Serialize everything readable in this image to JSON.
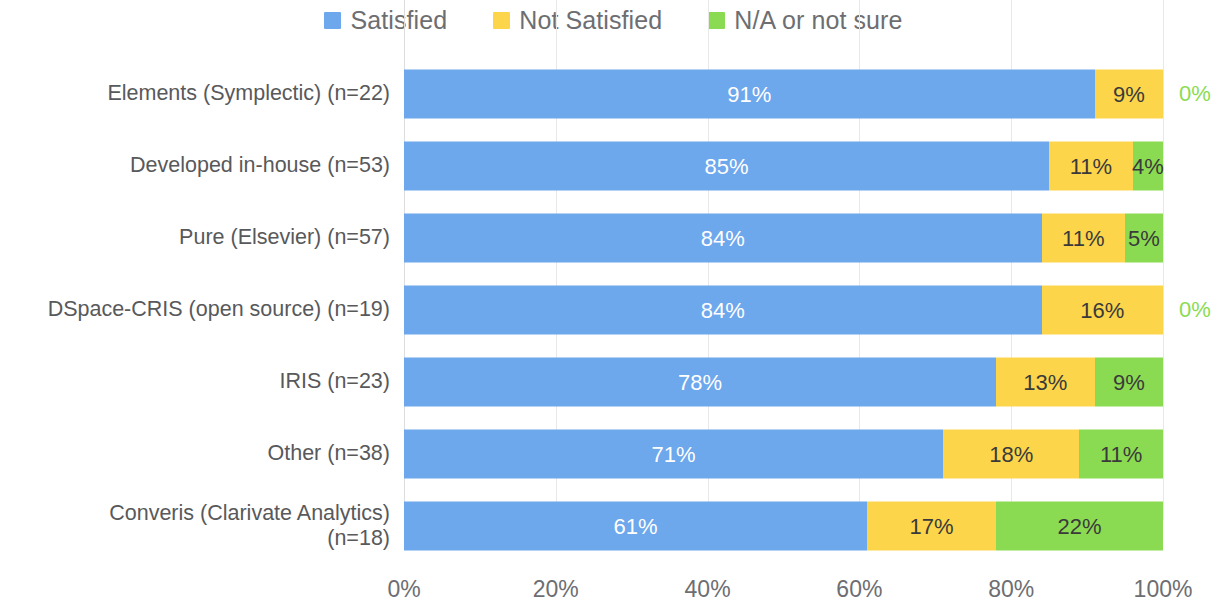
{
  "legend": {
    "items": [
      {
        "label": "Satisfied",
        "color": "#6DA7EC",
        "icon": "square-swatch-icon"
      },
      {
        "label": "Not Satisfied",
        "color": "#FCD54B",
        "icon": "square-swatch-icon"
      },
      {
        "label": "N/A or not sure",
        "color": "#8BDB52",
        "icon": "square-swatch-icon"
      }
    ]
  },
  "axis": {
    "x_ticks": [
      "0%",
      "20%",
      "40%",
      "60%",
      "80%",
      "100%"
    ],
    "x_tick_values": [
      0,
      20,
      40,
      60,
      80,
      100
    ]
  },
  "chart_data": {
    "type": "bar",
    "orientation": "horizontal",
    "stacked": true,
    "stack_mode": "percent",
    "title": "",
    "subtitle": "",
    "xlabel": "",
    "ylabel": "",
    "xlim": [
      0,
      100
    ],
    "grid": true,
    "legend_position": "top-center",
    "categories": [
      "Elements (Symplectic) (n=22)",
      "Developed in-house (n=53)",
      "Pure (Elsevier) (n=57)",
      "DSpace-CRIS (open source) (n=19)",
      "IRIS (n=23)",
      "Other (n=38)",
      "Converis (Clarivate Analytics)\n(n=18)"
    ],
    "series": [
      {
        "name": "Satisfied",
        "color": "#6DA7EC",
        "values": [
          91,
          85,
          84,
          84,
          78,
          71,
          61
        ]
      },
      {
        "name": "Not Satisfied",
        "color": "#FCD54B",
        "values": [
          9,
          11,
          11,
          16,
          13,
          18,
          17
        ]
      },
      {
        "name": "N/A or not sure",
        "color": "#8BDB52",
        "values": [
          0,
          4,
          5,
          0,
          9,
          11,
          22
        ]
      }
    ],
    "data_labels": [
      {
        "category": "Elements (Symplectic) (n=22)",
        "satisfied": "91%",
        "not_satisfied": "9%",
        "na": "0%",
        "na_outside": true
      },
      {
        "category": "Developed in-house (n=53)",
        "satisfied": "85%",
        "not_satisfied": "11%",
        "na": "4%",
        "na_outside": false
      },
      {
        "category": "Pure (Elsevier) (n=57)",
        "satisfied": "84%",
        "not_satisfied": "11%",
        "na": "5%",
        "na_outside": false
      },
      {
        "category": "DSpace-CRIS (open source) (n=19)",
        "satisfied": "84%",
        "not_satisfied": "16%",
        "na": "0%",
        "na_outside": true
      },
      {
        "category": "IRIS (n=23)",
        "satisfied": "78%",
        "not_satisfied": "13%",
        "na": "9%",
        "na_outside": false
      },
      {
        "category": "Other (n=38)",
        "satisfied": "71%",
        "not_satisfied": "18%",
        "na": "11%",
        "na_outside": false
      },
      {
        "category": "Converis (Clarivate Analytics)\n(n=18)",
        "satisfied": "61%",
        "not_satisfied": "17%",
        "na": "22%",
        "na_outside": false
      }
    ]
  }
}
